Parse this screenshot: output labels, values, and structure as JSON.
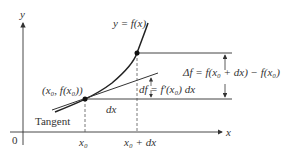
{
  "diagram": {
    "axes": {
      "x_label": "x",
      "y_label": "y",
      "origin_label": "0"
    },
    "curve_label": "y = f(x)",
    "point_label": "(x₀, f(x₀))",
    "tangent_label": "Tangent",
    "dx_label": "dx",
    "df_label": "df = f′(x₀) dx",
    "delta_f_label": "Δf = f(x₀ + dx) − f(x₀)",
    "tick_x0": "x₀",
    "tick_x0_dx": "x₀ + dx",
    "colors": {
      "line": "#333333",
      "curve": "#222222",
      "guide": "#555555"
    }
  }
}
